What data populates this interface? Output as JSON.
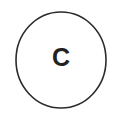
{
  "badge": {
    "shape": "circle-outline",
    "letter": "C",
    "letter_weight": "bold",
    "outline_color": "#2b2b2b",
    "letter_color": "#222222",
    "background_color": "#ffffff",
    "outline_thickness_px": 1.6,
    "circle_center_x": 61,
    "circle_center_y": 60,
    "circle_radius_x": 45,
    "circle_radius_y": 48
  }
}
